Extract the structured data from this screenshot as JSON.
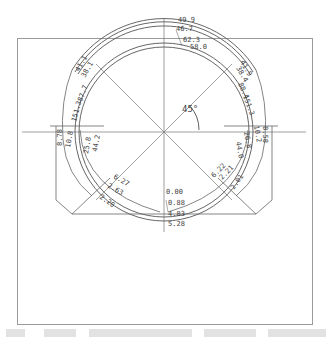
{
  "figure": {
    "type": "tunnel-cross-section-monitoring-diagram",
    "angle_label": "45°",
    "caption_visible": "faint / illegible Chinese caption text at bottom"
  },
  "labels": {
    "crown": [
      "49.9",
      "46.7",
      "62.3",
      "58.0"
    ],
    "upper_left": [
      "41.1",
      "38.1",
      "87.7",
      "151.3"
    ],
    "upper_right": [
      "41.9",
      "38.4",
      "88.4",
      "151.3"
    ],
    "left_wall": [
      "8.78",
      "10.8",
      "25.8",
      "44.2"
    ],
    "right_wall": [
      "8.58",
      "10.2",
      "26.8",
      "44.0"
    ],
    "lower_left": [
      "6.27",
      "2.63",
      "2.20"
    ],
    "lower_right": [
      "6.22",
      "2.21",
      "2.01"
    ],
    "invert": [
      "0.00",
      "0.88",
      "4.83",
      "5.28"
    ]
  },
  "colors": {
    "line": "#555555",
    "frame": "#999999",
    "text": "#444444"
  }
}
